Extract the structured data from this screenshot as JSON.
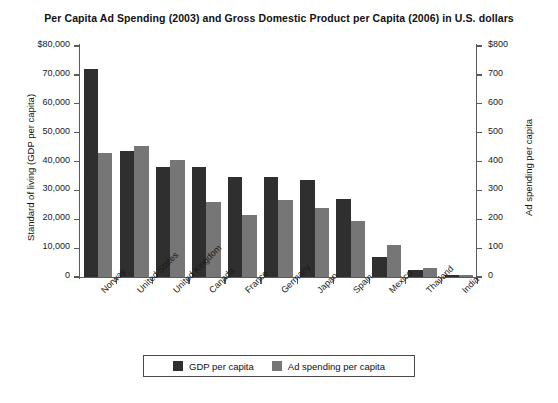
{
  "chart_data": {
    "type": "bar",
    "title": "Per Capita Ad Spending (2003) and Gross Domestic Product per Capita (2006) in U.S. dollars",
    "categories": [
      "Norway",
      "United States",
      "United Kingdom",
      "Canada",
      "France",
      "Germany",
      "Japan",
      "Spain",
      "Mexico",
      "Thailand",
      "India"
    ],
    "series": [
      {
        "name": "GDP per capita",
        "axis": "left",
        "color": "#2f2f2f",
        "values": [
          72000,
          43500,
          38000,
          38000,
          34800,
          34500,
          33500,
          27000,
          7000,
          2500,
          800
        ]
      },
      {
        "name": "Ad spending per capita",
        "axis": "right",
        "color": "#767676",
        "values": [
          430,
          455,
          405,
          260,
          215,
          265,
          240,
          195,
          110,
          30,
          8
        ]
      }
    ],
    "xlabel": "",
    "ylabel": "Standard of living (GDP per capita)",
    "ylabel_right": "Ad spending per capita",
    "ylim": [
      0,
      80000
    ],
    "ylim_right": [
      0,
      800
    ],
    "yticks_left": [
      "0",
      "10,000",
      "20,000",
      "30,000",
      "40,000",
      "50,000",
      "60,000",
      "70,000",
      "$80,000"
    ],
    "yticks_right": [
      "0",
      "100",
      "200",
      "300",
      "400",
      "500",
      "600",
      "700",
      "$800"
    ],
    "grid": false,
    "legend_position": "bottom"
  },
  "legend": {
    "items": [
      {
        "label": "GDP per capita",
        "color": "#2f2f2f"
      },
      {
        "label": "Ad spending per capita",
        "color": "#767676"
      }
    ]
  }
}
